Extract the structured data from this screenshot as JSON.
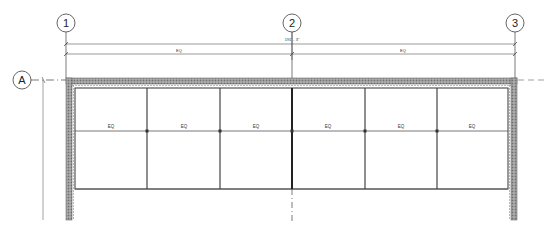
{
  "drawing": {
    "type": "architectural plan - curtain wall elevation/plan",
    "grids": {
      "vertical": [
        {
          "label": "1",
          "x": 66
        },
        {
          "label": "2",
          "x": 292
        },
        {
          "label": "3",
          "x": 515
        }
      ],
      "horizontal": [
        {
          "label": "A",
          "y": 80
        }
      ]
    },
    "dimensions": {
      "overall": "191' - 3\"",
      "segments": [
        "EQ",
        "EQ"
      ]
    },
    "panel_labels": [
      "EQ",
      "EQ",
      "EQ",
      "EQ",
      "EQ",
      "EQ"
    ],
    "colors": {
      "line": "#444444",
      "wall_hatch": "#8a8a8a",
      "background": "#ffffff"
    }
  }
}
